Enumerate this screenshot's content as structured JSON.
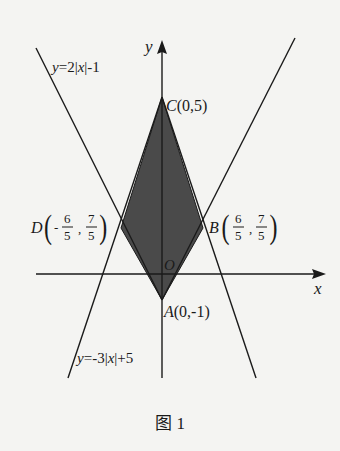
{
  "figure": {
    "caption": "图 1",
    "axes": {
      "x_label": "x",
      "y_label": "y",
      "origin_label": "O"
    },
    "curves": [
      {
        "name": "upper-v",
        "equation": "y=2|x|-1"
      },
      {
        "name": "lower-v",
        "equation": "y=-3|x|+5"
      }
    ],
    "points": {
      "A": {
        "label": "A",
        "coords": "(0,-1)"
      },
      "B": {
        "label": "B",
        "x_num": "6",
        "x_den": "5",
        "y_num": "7",
        "y_den": "5",
        "x_sign": ""
      },
      "C": {
        "label": "C",
        "coords": "(0,5)"
      },
      "D": {
        "label": "D",
        "x_num": "6",
        "x_den": "5",
        "y_num": "7",
        "y_den": "5",
        "x_sign": "-"
      }
    },
    "shaded_region": "quadrilateral ABCD",
    "colors": {
      "shade": "#4a4a4a",
      "line": "#1a1a1a",
      "background": "#f4f4f2"
    }
  }
}
